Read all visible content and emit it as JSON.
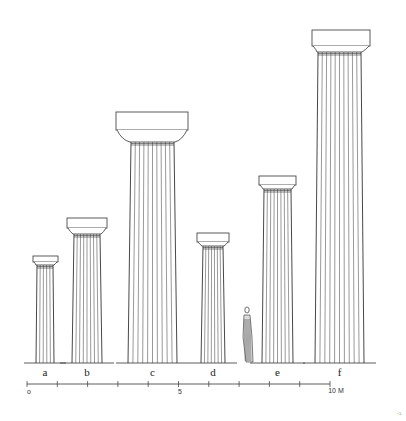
{
  "columns": [
    {
      "label": "a",
      "abacus": [
        33,
        256,
        58,
        262
      ],
      "echinus_bottom": 265,
      "shaft_top": [
        37,
        53
      ],
      "shaft_bottom": [
        36,
        54
      ],
      "flutes": 5
    },
    {
      "label": "b",
      "abacus": [
        67,
        218,
        107,
        228
      ],
      "echinus_bottom": 234,
      "shaft_top": [
        74,
        100
      ],
      "shaft_bottom": [
        72,
        102
      ],
      "flutes": 8
    },
    {
      "label": "c",
      "abacus": [
        116,
        112,
        188,
        130
      ],
      "echinus_bottom": 142,
      "shaft_top": [
        131,
        174
      ],
      "shaft_bottom": [
        128,
        177
      ],
      "flutes": 10
    },
    {
      "label": "d",
      "abacus": [
        197,
        233,
        229,
        242
      ],
      "echinus_bottom": 246,
      "shaft_top": [
        203,
        223
      ],
      "shaft_bottom": [
        201,
        225
      ],
      "flutes": 7
    },
    {
      "label": "e",
      "abacus": [
        259,
        176,
        296,
        185
      ],
      "echinus_bottom": 189,
      "shaft_top": [
        264,
        291
      ],
      "shaft_bottom": [
        262,
        293
      ],
      "flutes": 8
    },
    {
      "label": "f",
      "abacus": [
        312,
        30,
        370,
        46
      ],
      "echinus_bottom": 52,
      "shaft_top": [
        318,
        361
      ],
      "shaft_bottom": [
        315,
        364
      ],
      "flutes": 10
    }
  ],
  "ground_y": 363,
  "figure": {
    "name": "human-figure-for-scale",
    "x": 243,
    "y": 307
  },
  "scale": {
    "start_label": "o",
    "mid_label": "5",
    "end_label": "10",
    "unit": "M",
    "x_start": 27,
    "x_end": 330,
    "y": 384,
    "ticks": 10
  },
  "page_mark": "·¹"
}
